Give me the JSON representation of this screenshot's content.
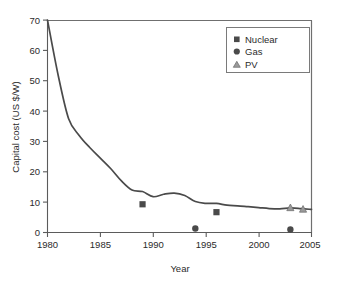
{
  "chart_data": {
    "type": "line",
    "title": "",
    "xlabel": "Year",
    "ylabel": "Capital cost (US $/W)",
    "xlim": [
      1980,
      2005
    ],
    "ylim": [
      0,
      70
    ],
    "grid": false,
    "legend_position": "top-right",
    "x_ticks": [
      1980,
      1985,
      1990,
      1995,
      2000,
      2005
    ],
    "y_ticks": [
      0,
      10,
      20,
      30,
      40,
      50,
      60,
      70
    ],
    "series": [
      {
        "name": "PV module price curve",
        "type": "line",
        "color": "#4a4a4a",
        "x": [
          1980,
          1981,
          1982,
          1983,
          1984,
          1985,
          1986,
          1987,
          1988,
          1989,
          1990,
          1991,
          1992,
          1993,
          1994,
          1995,
          1996,
          1997,
          1998,
          1999,
          2000,
          2001,
          2002,
          2003,
          2004,
          2005
        ],
        "y": [
          70.0,
          52.0,
          37.5,
          32.0,
          28.0,
          24.5,
          21.0,
          17.0,
          14.0,
          13.5,
          11.8,
          12.6,
          13.0,
          12.2,
          10.2,
          9.6,
          9.6,
          9.0,
          8.8,
          8.5,
          8.2,
          7.9,
          7.8,
          8.1,
          7.9,
          7.6
        ]
      },
      {
        "name": "Nuclear",
        "type": "scatter",
        "marker": "square",
        "color": "#4a4a4a",
        "points": [
          [
            1989,
            9.3
          ],
          [
            1996,
            6.7
          ]
        ]
      },
      {
        "name": "Gas",
        "type": "scatter",
        "marker": "circle",
        "color": "#4a4a4a",
        "points": [
          [
            1994,
            1.3
          ],
          [
            2003,
            1.0
          ]
        ]
      },
      {
        "name": "PV",
        "type": "scatter",
        "marker": "triangle",
        "color": "#9a9a9a",
        "points": [
          [
            2003,
            8.2
          ],
          [
            2004.2,
            7.7
          ]
        ]
      }
    ],
    "legend": [
      {
        "label": "Nuclear",
        "marker": "square",
        "color": "#4a4a4a"
      },
      {
        "label": "Gas",
        "marker": "circle",
        "color": "#4a4a4a"
      },
      {
        "label": "PV",
        "marker": "triangle",
        "color": "#9a9a9a"
      }
    ]
  },
  "axes": {
    "y_tick_labels": [
      "0",
      "10",
      "20",
      "30",
      "40",
      "50",
      "60",
      "70"
    ],
    "x_tick_labels": [
      "1980",
      "1985",
      "1990",
      "1995",
      "2000",
      "2005"
    ],
    "x_title": "Year",
    "y_title": "Capital cost (US $/W)"
  },
  "legend": {
    "items": [
      {
        "label": "Nuclear"
      },
      {
        "label": "Gas"
      },
      {
        "label": "PV"
      }
    ]
  }
}
